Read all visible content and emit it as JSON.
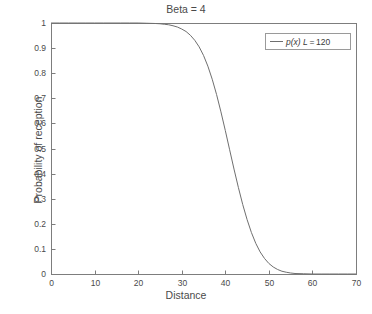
{
  "chart_data": {
    "type": "line",
    "title": "Beta = 4",
    "xlabel": "Distance",
    "ylabel": "Probability of reception",
    "xlim": [
      0,
      70
    ],
    "ylim": [
      0,
      1
    ],
    "grid": false,
    "legend_position": "top-right",
    "xticks": [
      "0",
      "10",
      "20",
      "30",
      "40",
      "50",
      "60",
      "70"
    ],
    "xtick_values": [
      0,
      10,
      20,
      30,
      40,
      50,
      60,
      70
    ],
    "yticks": [
      "0",
      "0.1",
      "0.2",
      "0.3",
      "0.4",
      "0.5",
      "0.6",
      "0.7",
      "0.8",
      "0.9",
      "1"
    ],
    "ytick_values": [
      0,
      0.1,
      0.2,
      0.3,
      0.4,
      0.5,
      0.6,
      0.7,
      0.8,
      0.9,
      1
    ],
    "series": [
      {
        "name": "p(x) L = 120",
        "name_parts": {
          "function": "p(x)",
          "param": "L",
          "equals": "=",
          "value": "120"
        },
        "color": "#6f6f6f",
        "x": [
          0,
          2,
          4,
          6,
          8,
          10,
          12,
          14,
          16,
          18,
          20,
          22,
          24,
          25,
          26,
          27,
          28,
          29,
          30,
          31,
          32,
          33,
          34,
          35,
          36,
          37,
          38,
          39,
          40,
          41,
          42,
          43,
          44,
          45,
          46,
          47,
          48,
          49,
          50,
          51,
          52,
          53,
          54,
          55,
          56,
          58,
          60,
          62,
          64,
          66,
          68,
          70
        ],
        "values": [
          1,
          1,
          1,
          1,
          1,
          1,
          1,
          1,
          1,
          1,
          1,
          0.999,
          0.998,
          0.997,
          0.995,
          0.993,
          0.989,
          0.984,
          0.976,
          0.966,
          0.951,
          0.931,
          0.905,
          0.871,
          0.828,
          0.776,
          0.715,
          0.646,
          0.572,
          0.495,
          0.418,
          0.345,
          0.277,
          0.217,
          0.165,
          0.122,
          0.088,
          0.062,
          0.042,
          0.028,
          0.018,
          0.011,
          0.007,
          0.004,
          0.002,
          0.001,
          0,
          0,
          0,
          0,
          0,
          0
        ]
      }
    ]
  },
  "legend": {
    "entries": [
      {
        "label": "p(x) L = 120",
        "swatch": "line-swatch"
      }
    ]
  },
  "axes": {
    "frame_color": "#7d7d7d",
    "tick_color": "#7d7d7d"
  }
}
